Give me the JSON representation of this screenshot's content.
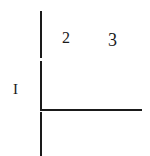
{
  "diagram": {
    "type": "quadrant-axes",
    "labels": {
      "region_1": "I",
      "region_2": "2",
      "region_3": "3"
    },
    "line_color": "#1a1a1a",
    "background": "#ffffff"
  }
}
